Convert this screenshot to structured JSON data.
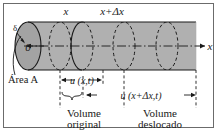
{
  "figure": {
    "colors": {
      "cylinder_fill": "#b0b0b0",
      "cap_fill": "#a3a3a3",
      "outline": "#1a1a1a",
      "border": "#6b6b6b",
      "background": "#ffffff"
    },
    "border_label": "figure-border",
    "labels": {
      "top_left_x": "x",
      "top_right_x": "x+Δx",
      "axis_x": "x",
      "origin": "0",
      "delta": "δ",
      "area": "Área A",
      "u_x_t": "u (x,t)",
      "u_xdx_t": "u (x+Δx,t)",
      "volume_original_line1": "Volume",
      "volume_original_line2": "original",
      "volume_deslocado_line1": "Volume",
      "volume_deslocado_line2": "deslocado"
    },
    "elements": {
      "left_cap": "left-end-cap-ellipse",
      "solid_section_ellipse": "solid-cross-section-ellipse",
      "dashed_ellipses": [
        "dashed-cross-section-1",
        "dashed-cross-section-2",
        "dashed-cross-section-3"
      ],
      "axis": "dash-dot-axis-line",
      "origin_arrow": "origin-pointer-arrow",
      "area_leader": "area-leader-curve",
      "brace": "volume-original-brace",
      "dimension_arrow_1": "u-x-t-dimension-arrow",
      "dimension_arrow_2": "u-x-dx-t-dimension-arrow"
    }
  }
}
